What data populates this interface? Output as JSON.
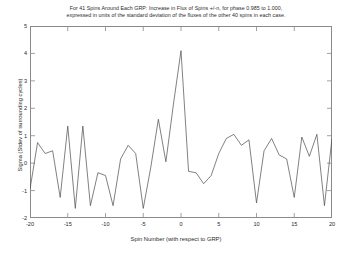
{
  "chart_data": {
    "type": "line",
    "title": "For 41 Spins Around Each GRP: Increase in Flux of Spins +/-n, for phase 0.985 to 1.000, expressed in units of the standard deviation of the fluxes of the other 40 spins in each case.",
    "title_lines": [
      "For 41 Spins Around Each GRP: Increase in Flux of Spins +/-n, for phase 0.985 to 1.000,",
      "expressed in units of the standard deviation of the fluxes of the other 40 spins in each case."
    ],
    "xlabel": "Spin Number (with respect to GRP)",
    "ylabel": "Sigma (Stdev of surrounding cycles)",
    "xlim": [
      -20,
      20
    ],
    "ylim": [
      -2,
      5
    ],
    "xticks": [
      -20,
      -15,
      -10,
      -5,
      0,
      5,
      10,
      15,
      20
    ],
    "xticklabels": [
      "-20",
      "-15",
      "-10",
      "-5",
      "0",
      "5",
      "10",
      "15",
      "20"
    ],
    "yticks": [
      -2,
      -1,
      0,
      1,
      2,
      3,
      4,
      5
    ],
    "yticklabels": [
      "-2",
      "-1",
      "0",
      "1",
      "2",
      "3",
      "4",
      "5"
    ],
    "grid": false,
    "legend": "none",
    "line_color": "#4a4a4a",
    "line_width": 0.7,
    "x": [
      -20,
      -19,
      -18,
      -17,
      -16,
      -15,
      -14,
      -13,
      -12,
      -11,
      -10,
      -9,
      -8,
      -7,
      -6,
      -5,
      -4,
      -3,
      -2,
      -1,
      0,
      1,
      2,
      3,
      4,
      5,
      6,
      7,
      8,
      9,
      10,
      11,
      12,
      13,
      14,
      15,
      16,
      17,
      18,
      19,
      20
    ],
    "values": [
      -0.95,
      0.75,
      0.35,
      0.45,
      -1.25,
      1.35,
      -1.65,
      1.35,
      -1.55,
      -0.35,
      -0.45,
      -1.55,
      0.15,
      0.65,
      0.35,
      -1.65,
      -0.15,
      1.6,
      0.05,
      2.15,
      4.1,
      -0.3,
      -0.35,
      -0.75,
      -0.45,
      0.35,
      0.9,
      1.05,
      0.65,
      0.85,
      -1.45,
      0.45,
      0.9,
      0.3,
      0.15,
      -1.25,
      0.95,
      0.25,
      1.05,
      -1.55,
      0.9
    ]
  }
}
